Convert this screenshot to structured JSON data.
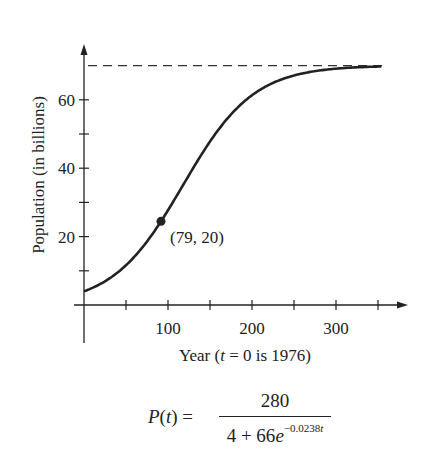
{
  "chart_data": {
    "type": "line",
    "title": "",
    "xlabel_prefix": "Year (",
    "xlabel_var": "t",
    "xlabel_suffix": " = 0 is 1976)",
    "xlabel": "Year (t = 0 is 1976)",
    "ylabel": "Population  (in billions)",
    "x_ticks": [
      50,
      100,
      150,
      200,
      250,
      300,
      350
    ],
    "x_tick_labels": [
      "100",
      "200",
      "300"
    ],
    "y_ticks": [
      10,
      20,
      30,
      40,
      50,
      60
    ],
    "y_tick_labels": [
      "20",
      "40",
      "60"
    ],
    "xlim": [
      0,
      380
    ],
    "ylim": [
      0,
      77
    ],
    "grid": false,
    "series": [
      {
        "name": "P(t)",
        "function": "280/(4+66*exp(-0.0238*t))",
        "t_range": [
          0,
          355
        ],
        "style": "solid"
      },
      {
        "name": "asymptote",
        "y": 70,
        "style": "dashed"
      }
    ],
    "annotations": [
      {
        "x": 79,
        "y": 20,
        "label": "(79, 20)",
        "marker": "dot"
      }
    ]
  },
  "formula": {
    "lhs": "P(t) =",
    "numerator": "280",
    "denominator_base": "4 + 66e",
    "exponent_coef": "−0.0238",
    "exponent_var": "t"
  },
  "colors": {
    "ink": "#222222",
    "background": "#ffffff"
  }
}
